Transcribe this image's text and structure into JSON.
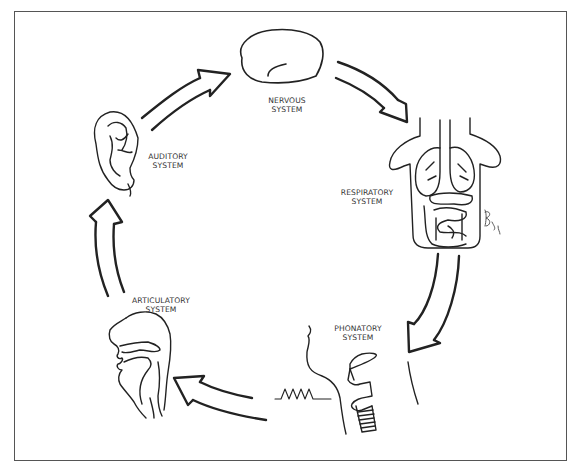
{
  "diagram": {
    "type": "cycle",
    "colors": {
      "line": "#222222",
      "frame": "#555555",
      "text": "#333333",
      "background": "#ffffff"
    },
    "nodes": [
      {
        "id": "nervous",
        "icon": "brain-icon",
        "label_line1": "NERVOUS",
        "label_line2": "SYSTEM"
      },
      {
        "id": "respiratory",
        "icon": "torso-organs-icon",
        "label_line1": "RESPIRATORY",
        "label_line2": "SYSTEM"
      },
      {
        "id": "phonatory",
        "icon": "larynx-icon",
        "label_line1": "PHONATORY",
        "label_line2": "SYSTEM"
      },
      {
        "id": "articulatory",
        "icon": "head-profile-icon",
        "label_line1": "ARTICULATORY",
        "label_line2": "SYSTEM"
      },
      {
        "id": "auditory",
        "icon": "ear-icon",
        "label_line1": "AUDITORY",
        "label_line2": "SYSTEM"
      }
    ],
    "edges": [
      {
        "from": "nervous",
        "to": "respiratory"
      },
      {
        "from": "respiratory",
        "to": "phonatory"
      },
      {
        "from": "phonatory",
        "to": "articulatory"
      },
      {
        "from": "articulatory",
        "to": "auditory"
      },
      {
        "from": "auditory",
        "to": "nervous"
      }
    ],
    "annotations": {
      "waveform": "sound-wave-icon",
      "signature": "artist-signature"
    }
  }
}
